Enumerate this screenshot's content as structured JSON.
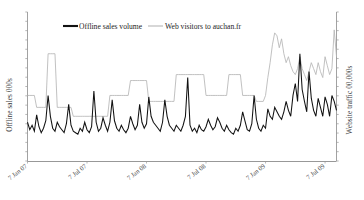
{
  "chart_data": {
    "type": "line",
    "title": "",
    "subtitle": "",
    "xlabel": "",
    "ylabel": "Offline sales 000s",
    "y2label": "Website traffic 00,000s",
    "grid": false,
    "legend_position": "top-center",
    "x_tick_labels": [
      "7 Jan 07",
      "7 Jul 07",
      "7 Jan 08",
      "7 Jul 08",
      "7 Jan 09",
      "7 Jul 09"
    ],
    "x_tick_positions": [
      0,
      26,
      52,
      78,
      104,
      130
    ],
    "x": [
      0,
      1,
      2,
      3,
      4,
      5,
      6,
      7,
      8,
      9,
      10,
      11,
      12,
      13,
      14,
      15,
      16,
      17,
      18,
      19,
      20,
      21,
      22,
      23,
      24,
      25,
      26,
      27,
      28,
      29,
      30,
      31,
      32,
      33,
      34,
      35,
      36,
      37,
      38,
      39,
      40,
      41,
      42,
      43,
      44,
      45,
      46,
      47,
      48,
      49,
      50,
      51,
      52,
      53,
      54,
      55,
      56,
      57,
      58,
      59,
      60,
      61,
      62,
      63,
      64,
      65,
      66,
      67,
      68,
      69,
      70,
      71,
      72,
      73,
      74,
      75,
      76,
      77,
      78,
      79,
      80,
      81,
      82,
      83,
      84,
      85,
      86,
      87,
      88,
      89,
      90,
      91,
      92,
      93,
      94,
      95,
      96,
      97,
      98,
      99,
      100,
      101,
      102,
      103,
      104,
      105,
      106,
      107,
      108,
      109,
      110,
      111,
      112,
      113,
      114,
      115,
      116,
      117,
      118,
      119,
      120,
      121,
      122,
      123,
      124,
      125,
      126,
      127,
      128,
      129,
      130,
      131,
      132,
      133,
      134,
      135
    ],
    "xlim": [
      0,
      135
    ],
    "ylim": [
      0,
      100
    ],
    "y2lim": [
      0,
      100
    ],
    "series": [
      {
        "name": "Offline sales volume",
        "axis": "left",
        "color": "#121212",
        "values": [
          26,
          21,
          24,
          20,
          31,
          23,
          19,
          22,
          27,
          44,
          30,
          22,
          20,
          26,
          23,
          21,
          19,
          25,
          38,
          24,
          20,
          19,
          18,
          22,
          20,
          26,
          21,
          19,
          23,
          47,
          26,
          20,
          22,
          29,
          24,
          20,
          26,
          41,
          27,
          22,
          20,
          24,
          21,
          19,
          22,
          30,
          25,
          21,
          24,
          38,
          26,
          22,
          25,
          43,
          30,
          26,
          24,
          22,
          20,
          26,
          41,
          30,
          24,
          22,
          20,
          24,
          22,
          20,
          24,
          30,
          56,
          24,
          20,
          22,
          19,
          24,
          21,
          20,
          23,
          28,
          24,
          21,
          23,
          29,
          26,
          22,
          20,
          24,
          21,
          19,
          18,
          22,
          20,
          24,
          33,
          27,
          21,
          20,
          25,
          44,
          28,
          22,
          20,
          24,
          22,
          35,
          30,
          28,
          36,
          33,
          30,
          28,
          33,
          40,
          34,
          30,
          44,
          52,
          40,
          72,
          48,
          40,
          33,
          60,
          42,
          34,
          30,
          42,
          36,
          30,
          43,
          38,
          30,
          44,
          40,
          34
        ]
      },
      {
        "name": "Web visitors to auchan.fr",
        "axis": "right",
        "color": "#b6b6b6",
        "values": [
          44,
          44,
          44,
          44,
          36,
          36,
          36,
          36,
          36,
          72,
          72,
          72,
          72,
          36,
          36,
          36,
          36,
          36,
          36,
          36,
          30,
          30,
          30,
          30,
          30,
          30,
          30,
          30,
          30,
          30,
          30,
          30,
          30,
          30,
          30,
          30,
          44,
          44,
          44,
          44,
          44,
          44,
          44,
          44,
          44,
          54,
          54,
          54,
          54,
          54,
          54,
          54,
          54,
          40,
          40,
          40,
          40,
          40,
          40,
          40,
          40,
          40,
          40,
          40,
          40,
          58,
          58,
          58,
          58,
          58,
          58,
          58,
          58,
          58,
          58,
          58,
          58,
          58,
          44,
          44,
          44,
          44,
          44,
          44,
          44,
          44,
          44,
          44,
          58,
          58,
          58,
          58,
          58,
          58,
          44,
          44,
          44,
          44,
          44,
          44,
          40,
          40,
          40,
          40,
          44,
          56,
          66,
          78,
          86,
          84,
          76,
          82,
          72,
          66,
          70,
          64,
          60,
          58,
          62,
          70,
          62,
          58,
          54,
          60,
          66,
          62,
          58,
          66,
          60,
          56,
          70,
          64,
          58,
          62,
          88,
          70
        ]
      }
    ]
  },
  "legend": {
    "items": [
      {
        "label": "Offline sales volume",
        "color": "#121212",
        "style": "thick-solid"
      },
      {
        "label": "Web visitors to auchan.fr",
        "color": "#b6b6b6",
        "style": "thin-solid"
      }
    ]
  },
  "axes": {
    "left_title": "Offline sales 000s",
    "right_title": "Website traffic 00,000s",
    "left_tick_count": 16,
    "right_tick_count": 16
  }
}
